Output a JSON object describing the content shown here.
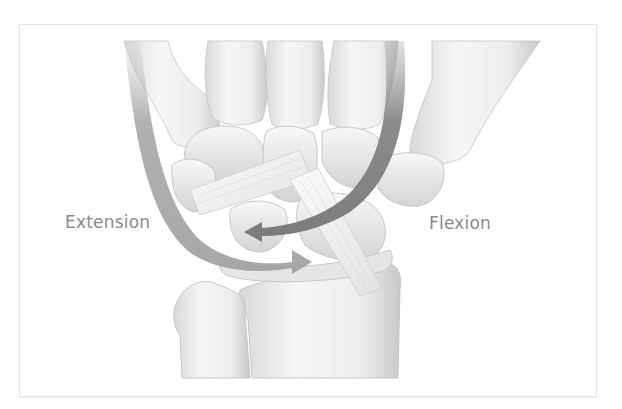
{
  "figure": {
    "labels": {
      "extension": "Extension",
      "flexion": "Flexion"
    },
    "arrows": [
      {
        "name": "extension-arrow",
        "direction": "sweeps from top-left down and right toward center",
        "color": "#9a9a9a"
      },
      {
        "name": "flexion-arrow",
        "direction": "sweeps from top-right down and left toward center",
        "color": "#7d7d7d"
      }
    ],
    "colors": {
      "background": "#ffffff",
      "frame_border": "#e4e4e4",
      "bone_light": "#f3f3f3",
      "bone_shade": "#cfcfcf",
      "label_text": "#8a8a8a"
    }
  }
}
